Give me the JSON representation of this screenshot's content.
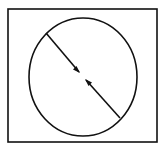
{
  "diagram": {
    "stroke_color": "#111111",
    "background": "#ffffff",
    "frame": {
      "x": 8,
      "y": 9,
      "width": 149,
      "height": 133
    },
    "circle": {
      "cx": 83,
      "cy": 77,
      "rx": 54,
      "ry": 59
    },
    "diameter": {
      "x1": 46,
      "y1": 33,
      "x2": 120,
      "y2": 118
    },
    "arrows": [
      {
        "direction": "toward-center",
        "tip_x": 80,
        "tip_y": 73
      },
      {
        "direction": "toward-center",
        "tip_x": 85,
        "tip_y": 79
      }
    ]
  }
}
